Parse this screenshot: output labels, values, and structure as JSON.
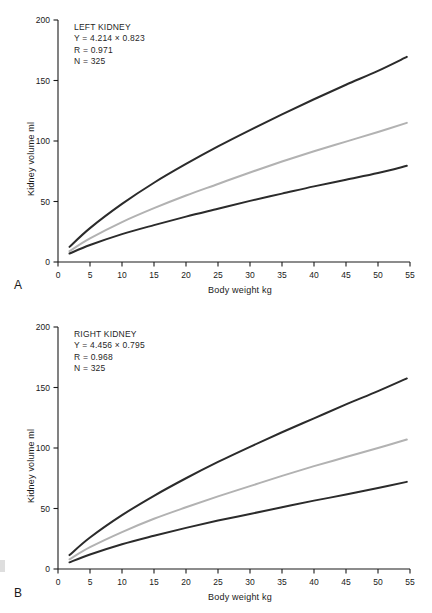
{
  "figure": {
    "panels": [
      {
        "letter": "A",
        "annotation": {
          "title": "LEFT KIDNEY",
          "equation": "Y = 4.214 × 0.823",
          "r": "R = 0.971",
          "n": "N = 325"
        }
      },
      {
        "letter": "B",
        "annotation": {
          "title": "RIGHT KIDNEY",
          "equation": "Y = 4.456 × 0.795",
          "r": "R = 0.968",
          "n": "N = 325"
        }
      }
    ]
  },
  "chart_data": [
    {
      "type": "line",
      "title": "LEFT KIDNEY",
      "panel": "A",
      "xlabel": "Body weight kg",
      "ylabel": "Kidney volume ml",
      "xlim": [
        0,
        55
      ],
      "ylim": [
        0,
        200
      ],
      "xticks": [
        0,
        5,
        10,
        15,
        20,
        25,
        30,
        35,
        40,
        45,
        50,
        55
      ],
      "yticks": [
        0,
        50,
        100,
        150,
        200
      ],
      "grid": false,
      "legend": "none",
      "annotations": [
        "LEFT KIDNEY",
        "Y = 4.214 × 0.823",
        "R = 0.971",
        "N = 325"
      ],
      "x": [
        1.8,
        5,
        10,
        15,
        20,
        25,
        30,
        35,
        40,
        45,
        50,
        54.5
      ],
      "series": [
        {
          "name": "upper-percentile",
          "color": "#2b2b2b",
          "values": [
            12.5,
            28.0,
            48.0,
            65.5,
            81.0,
            95.5,
            109.0,
            122.0,
            134.5,
            146.5,
            158.0,
            169.5
          ]
        },
        {
          "name": "mean",
          "color": "#b2b2b2",
          "values": [
            9.0,
            19.5,
            33.0,
            44.5,
            55.0,
            64.5,
            74.0,
            83.0,
            91.5,
            99.5,
            107.5,
            115.0
          ]
        },
        {
          "name": "lower-percentile",
          "color": "#2b2b2b",
          "values": [
            7.0,
            14.0,
            23.0,
            30.5,
            37.5,
            44.0,
            50.5,
            56.5,
            62.5,
            68.0,
            73.5,
            79.5
          ]
        }
      ]
    },
    {
      "type": "line",
      "title": "RIGHT KIDNEY",
      "panel": "B",
      "xlabel": "Body weight kg",
      "ylabel": "Kidney volume ml",
      "xlim": [
        0,
        55
      ],
      "ylim": [
        0,
        200
      ],
      "xticks": [
        0,
        5,
        10,
        15,
        20,
        25,
        30,
        35,
        40,
        45,
        50,
        55
      ],
      "yticks": [
        0,
        50,
        100,
        150,
        200
      ],
      "grid": false,
      "legend": "none",
      "annotations": [
        "RIGHT KIDNEY",
        "Y = 4.456 × 0.795",
        "R = 0.968",
        "N = 325"
      ],
      "x": [
        1.8,
        5,
        10,
        15,
        20,
        25,
        30,
        35,
        40,
        45,
        50,
        54.5
      ],
      "series": [
        {
          "name": "upper-percentile",
          "color": "#2b2b2b",
          "values": [
            11.5,
            26.0,
            44.5,
            60.5,
            75.0,
            88.5,
            101.0,
            113.0,
            124.5,
            136.0,
            147.0,
            157.5
          ]
        },
        {
          "name": "mean",
          "color": "#b2b2b2",
          "values": [
            8.0,
            18.0,
            30.5,
            41.5,
            51.0,
            60.0,
            68.5,
            77.0,
            85.0,
            92.5,
            100.0,
            107.0
          ]
        },
        {
          "name": "lower-percentile",
          "color": "#2b2b2b",
          "values": [
            5.5,
            12.0,
            20.5,
            27.5,
            34.0,
            40.0,
            45.5,
            51.0,
            56.5,
            61.5,
            67.0,
            72.0
          ]
        }
      ]
    }
  ]
}
